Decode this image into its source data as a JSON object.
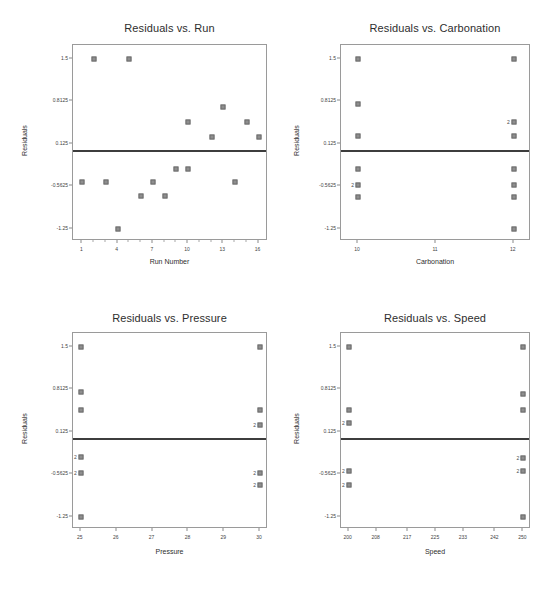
{
  "figure": {
    "background": "#ffffff",
    "marker_color": "#8e8e8e",
    "marker_edge_color": "#6d6d6d",
    "zero_line_color": "#3d3d3d",
    "axis_color": "#9a9a9a"
  },
  "chart_data": [
    {
      "type": "scatter",
      "title": "Residuals vs. Run",
      "xlabel": "Run Number",
      "ylabel": "Residuals",
      "xlim": [
        0.2,
        16.8
      ],
      "ylim": [
        -1.45,
        1.72
      ],
      "xticks": [
        1,
        4,
        7,
        10,
        13,
        16
      ],
      "xticklabels": [
        "1",
        "4",
        "7",
        "10",
        "13",
        "16"
      ],
      "xminorticks": [
        2,
        3,
        5,
        6,
        8,
        9,
        11,
        12,
        14,
        15
      ],
      "yticks": [
        1.5,
        0.8125,
        0.125,
        -0.5625,
        -1.25
      ],
      "yticklabels": [
        "1.5",
        "0.8125",
        "0.125",
        "-0.5625",
        "-1.25"
      ],
      "zero_line": 0.0,
      "grid": false,
      "points": [
        {
          "x": 2,
          "y": 1.5,
          "n": 1
        },
        {
          "x": 5,
          "y": 1.5,
          "n": 1
        },
        {
          "x": 13,
          "y": 0.71,
          "n": 1
        },
        {
          "x": 10,
          "y": 0.47,
          "n": 1
        },
        {
          "x": 15,
          "y": 0.47,
          "n": 1
        },
        {
          "x": 12,
          "y": 0.23,
          "n": 1
        },
        {
          "x": 16,
          "y": 0.23,
          "n": 1
        },
        {
          "x": 9,
          "y": -0.28,
          "n": 1
        },
        {
          "x": 10,
          "y": -0.28,
          "n": 1
        },
        {
          "x": 1,
          "y": -0.5,
          "n": 1
        },
        {
          "x": 3,
          "y": -0.5,
          "n": 1
        },
        {
          "x": 7,
          "y": -0.5,
          "n": 1
        },
        {
          "x": 14,
          "y": -0.5,
          "n": 1
        },
        {
          "x": 6,
          "y": -0.72,
          "n": 1
        },
        {
          "x": 8,
          "y": -0.72,
          "n": 1
        },
        {
          "x": 4,
          "y": -1.25,
          "n": 1
        }
      ]
    },
    {
      "type": "scatter",
      "title": "Residuals vs. Carbonation",
      "xlabel": "Carbonation",
      "ylabel": "Residuals",
      "xlim": [
        9.78,
        12.22
      ],
      "ylim": [
        -1.45,
        1.72
      ],
      "xticks": [
        10,
        11,
        12
      ],
      "xticklabels": [
        "10",
        "11",
        "12"
      ],
      "xminorticks": [],
      "yticks": [
        1.5,
        0.8125,
        0.125,
        -0.5625,
        -1.25
      ],
      "yticklabels": [
        "1.5",
        "0.8125",
        "0.125",
        "-0.5625",
        "-1.25"
      ],
      "zero_line": 0.0,
      "grid": false,
      "points": [
        {
          "x": 10,
          "y": 1.5,
          "n": 1
        },
        {
          "x": 12,
          "y": 1.5,
          "n": 1
        },
        {
          "x": 10,
          "y": 0.76,
          "n": 1
        },
        {
          "x": 12,
          "y": 0.47,
          "n": 2
        },
        {
          "x": 10,
          "y": 0.25,
          "n": 1
        },
        {
          "x": 12,
          "y": 0.25,
          "n": 1
        },
        {
          "x": 10,
          "y": -0.29,
          "n": 1
        },
        {
          "x": 12,
          "y": -0.29,
          "n": 1
        },
        {
          "x": 10,
          "y": -0.55,
          "n": 2
        },
        {
          "x": 12,
          "y": -0.55,
          "n": 1
        },
        {
          "x": 10,
          "y": -0.74,
          "n": 1
        },
        {
          "x": 12,
          "y": -0.74,
          "n": 1
        },
        {
          "x": 12,
          "y": -1.25,
          "n": 1
        }
      ]
    },
    {
      "type": "scatter",
      "title": "Residuals vs. Pressure",
      "xlabel": "Pressure",
      "ylabel": "Residuals",
      "xlim": [
        24.78,
        30.22
      ],
      "ylim": [
        -1.45,
        1.72
      ],
      "xticks": [
        25,
        26,
        27,
        28,
        29,
        30
      ],
      "xticklabels": [
        "25",
        "26",
        "27",
        "28",
        "29",
        "30"
      ],
      "xminorticks": [],
      "yticks": [
        1.5,
        0.8125,
        0.125,
        -0.5625,
        -1.25
      ],
      "yticklabels": [
        "1.5",
        "0.8125",
        "0.125",
        "-0.5625",
        "-1.25"
      ],
      "zero_line": 0.0,
      "grid": false,
      "points": [
        {
          "x": 25,
          "y": 1.5,
          "n": 1
        },
        {
          "x": 30,
          "y": 1.5,
          "n": 1
        },
        {
          "x": 25,
          "y": 0.76,
          "n": 1
        },
        {
          "x": 25,
          "y": 0.47,
          "n": 1
        },
        {
          "x": 30,
          "y": 0.47,
          "n": 1
        },
        {
          "x": 30,
          "y": 0.24,
          "n": 2
        },
        {
          "x": 25,
          "y": -0.29,
          "n": 2
        },
        {
          "x": 25,
          "y": -0.55,
          "n": 2
        },
        {
          "x": 30,
          "y": -0.55,
          "n": 2
        },
        {
          "x": 30,
          "y": -0.74,
          "n": 2
        },
        {
          "x": 25,
          "y": -1.25,
          "n": 1
        }
      ]
    },
    {
      "type": "scatter",
      "title": "Residuals vs. Speed",
      "xlabel": "Speed",
      "ylabel": "Residuals",
      "xlim": [
        197.8,
        252.2
      ],
      "ylim": [
        -1.45,
        1.72
      ],
      "xticks": [
        200,
        208,
        217,
        225,
        233,
        242,
        250
      ],
      "xticklabels": [
        "200",
        "208",
        "217",
        "225",
        "233",
        "242",
        "250"
      ],
      "xminorticks": [],
      "yticks": [
        1.5,
        0.8125,
        0.125,
        -0.5625,
        -1.25
      ],
      "yticklabels": [
        "1.5",
        "0.8125",
        "0.125",
        "-0.5625",
        "-1.25"
      ],
      "zero_line": 0.0,
      "grid": false,
      "points": [
        {
          "x": 200,
          "y": 1.5,
          "n": 1
        },
        {
          "x": 250,
          "y": 1.5,
          "n": 1
        },
        {
          "x": 250,
          "y": 0.74,
          "n": 1
        },
        {
          "x": 200,
          "y": 0.47,
          "n": 1
        },
        {
          "x": 250,
          "y": 0.47,
          "n": 1
        },
        {
          "x": 200,
          "y": 0.26,
          "n": 2
        },
        {
          "x": 250,
          "y": -0.3,
          "n": 2
        },
        {
          "x": 200,
          "y": -0.52,
          "n": 2
        },
        {
          "x": 250,
          "y": -0.52,
          "n": 2
        },
        {
          "x": 200,
          "y": -0.74,
          "n": 2
        },
        {
          "x": 250,
          "y": -1.25,
          "n": 1
        }
      ]
    }
  ]
}
